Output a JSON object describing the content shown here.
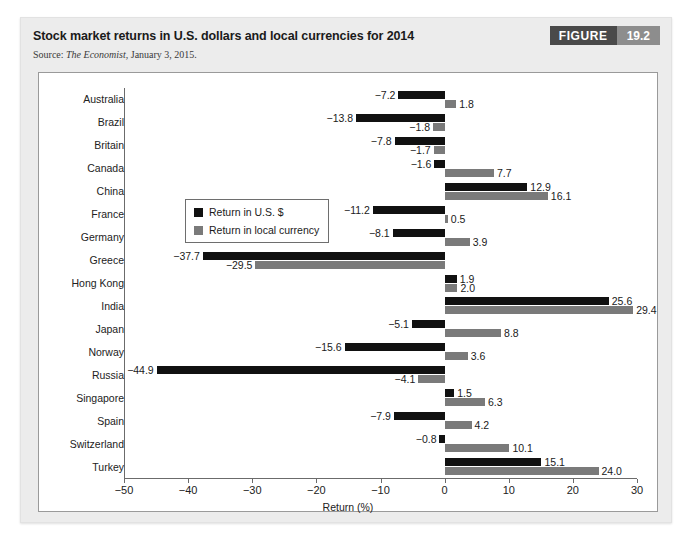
{
  "figure": {
    "title": "Stock market returns in U.S. dollars and local currencies for 2014",
    "source_prefix": "Source: ",
    "source_publication": "The Economist",
    "source_suffix": ", January 3, 2015.",
    "badge_word": "FIGURE",
    "badge_number": "19.2"
  },
  "colors": {
    "usd_bar": "#111111",
    "local_bar": "#7a7a7a",
    "badge_word_bg": "#4a4a4a",
    "badge_num_bg": "#8d8d8d",
    "panel_bg": "#ececec",
    "plot_bg": "#ffffff",
    "axis": "#6b6b6b"
  },
  "chart_data": {
    "type": "bar",
    "orientation": "horizontal",
    "title": "Stock market returns in U.S. dollars and local currencies for 2014",
    "xlabel": "Return (%)",
    "ylabel": "",
    "xlim": [
      -50,
      30
    ],
    "xticks": [
      -50,
      -40,
      -30,
      -20,
      -10,
      0,
      10,
      20,
      30
    ],
    "xtick_labels": [
      "−50",
      "−40",
      "−30",
      "−20",
      "−10",
      "0",
      "10",
      "20",
      "30"
    ],
    "grid": false,
    "legend_position": "upper-left-inside",
    "categories": [
      "Australia",
      "Brazil",
      "Britain",
      "Canada",
      "China",
      "France",
      "Germany",
      "Greece",
      "Hong Kong",
      "India",
      "Japan",
      "Norway",
      "Russia",
      "Singapore",
      "Spain",
      "Switzerland",
      "Turkey"
    ],
    "series": [
      {
        "name": "Return in U.S. $",
        "color": "#111111",
        "values": [
          -7.2,
          -13.8,
          -7.8,
          -1.6,
          12.9,
          -11.2,
          -8.1,
          -37.7,
          1.9,
          25.6,
          -5.1,
          -15.6,
          -44.9,
          1.5,
          -7.9,
          -0.8,
          15.1
        ],
        "labels": [
          "−7.2",
          "−13.8",
          "−7.8",
          "−1.6",
          "12.9",
          "−11.2",
          "−8.1",
          "−37.7",
          "1.9",
          "25.6",
          "−5.1",
          "−15.6",
          "−44.9",
          "1.5",
          "−7.9",
          "−0.8",
          "15.1"
        ]
      },
      {
        "name": "Return in local currency",
        "color": "#7a7a7a",
        "values": [
          1.8,
          -1.8,
          -1.7,
          7.7,
          16.1,
          0.5,
          3.9,
          -29.5,
          2.0,
          29.4,
          8.8,
          3.6,
          -4.1,
          6.3,
          4.2,
          10.1,
          24.0
        ],
        "labels": [
          "1.8",
          "−1.8",
          "−1.7",
          "7.7",
          "16.1",
          "0.5",
          "3.9",
          "−29.5",
          "2.0",
          "29.4",
          "8.8",
          "3.6",
          "−4.1",
          "6.3",
          "4.2",
          "10.1",
          "24.0"
        ]
      }
    ]
  }
}
